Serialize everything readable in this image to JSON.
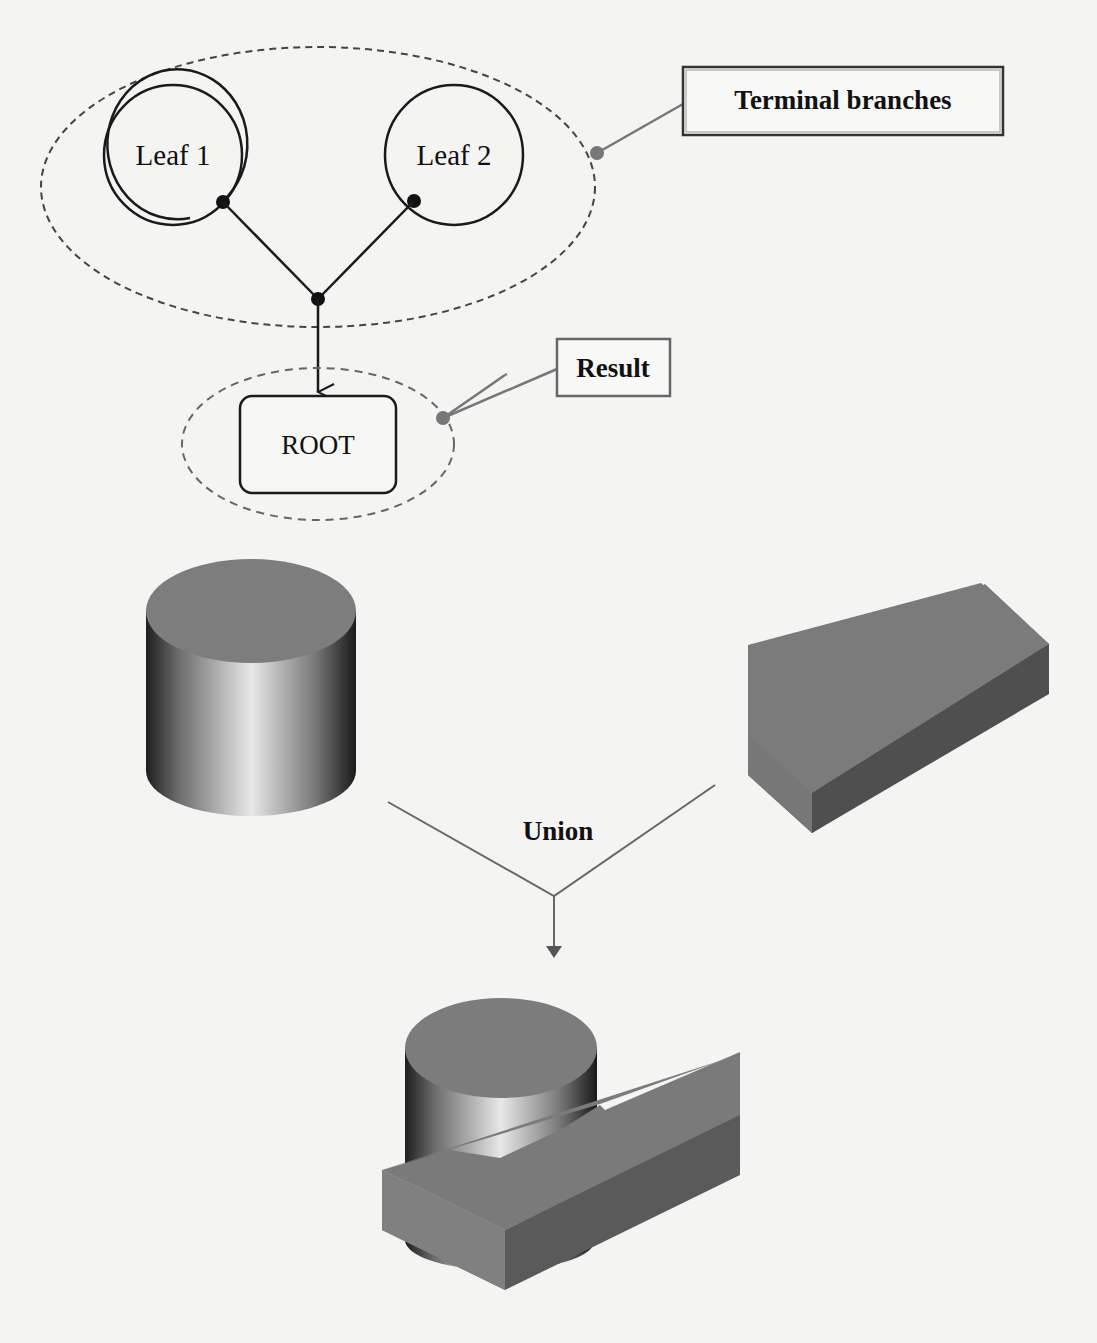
{
  "diagram": {
    "tree": {
      "leaves": [
        {
          "label": "Leaf 1"
        },
        {
          "label": "Leaf 2"
        }
      ],
      "root": {
        "label": "ROOT"
      },
      "callouts": {
        "terminal": "Terminal branches",
        "result": "Result"
      }
    },
    "csg": {
      "operation": "Union",
      "inputs": [
        "cylinder",
        "box"
      ],
      "output": "union-solid"
    }
  },
  "colors": {
    "background": "#f4f4f2",
    "line": "#1a1a1a",
    "callout_line": "#777777",
    "solid_face": "#7c7c7c",
    "solid_dark": "#555555"
  }
}
